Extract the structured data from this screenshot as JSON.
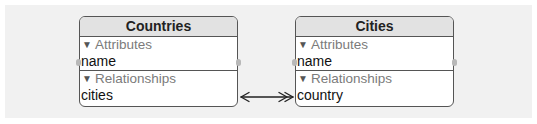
{
  "diagram": {
    "type": "core-data-entity-relationship",
    "background_color": "#f1f1f1",
    "entities": [
      {
        "id": "countries",
        "title": "Countries",
        "sections": {
          "attributes": {
            "label": "Attributes",
            "expanded": true,
            "items": [
              "name"
            ]
          },
          "relationships": {
            "label": "Relationships",
            "expanded": true,
            "items": [
              "cities"
            ]
          }
        }
      },
      {
        "id": "cities",
        "title": "Cities",
        "sections": {
          "attributes": {
            "label": "Attributes",
            "expanded": true,
            "items": [
              "name"
            ]
          },
          "relationships": {
            "label": "Relationships",
            "expanded": true,
            "items": [
              "country"
            ]
          }
        }
      }
    ],
    "relationships": [
      {
        "from": "Countries.cities",
        "to": "Cities.country",
        "from_end": "to-one arrow",
        "to_end": "to-many double arrow"
      }
    ],
    "icons": {
      "disclosure": "▼"
    }
  }
}
